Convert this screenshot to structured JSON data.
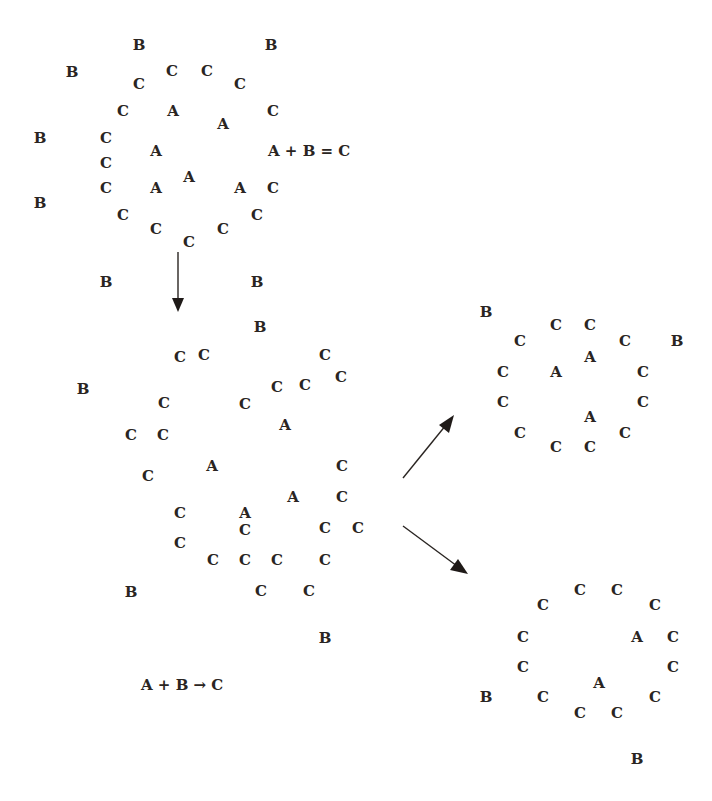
{
  "colors": {
    "ink": "#2a2522",
    "background": "#ffffff"
  },
  "panels": {
    "initial": {
      "label": "initial-state",
      "equation": "A + B = C",
      "particles": [
        {
          "s": "B",
          "p": [
            139,
            45
          ]
        },
        {
          "s": "B",
          "p": [
            271,
            45
          ]
        },
        {
          "s": "B",
          "p": [
            72,
            72
          ]
        },
        {
          "s": "B",
          "p": [
            40,
            138
          ]
        },
        {
          "s": "B",
          "p": [
            40,
            203
          ]
        },
        {
          "s": "B",
          "p": [
            106,
            282
          ]
        },
        {
          "s": "B",
          "p": [
            257,
            282
          ]
        },
        {
          "s": "C",
          "p": [
            172,
            71
          ]
        },
        {
          "s": "C",
          "p": [
            207,
            71
          ]
        },
        {
          "s": "C",
          "p": [
            139,
            84
          ]
        },
        {
          "s": "C",
          "p": [
            240,
            84
          ]
        },
        {
          "s": "C",
          "p": [
            123,
            111
          ]
        },
        {
          "s": "C",
          "p": [
            273,
            111
          ]
        },
        {
          "s": "C",
          "p": [
            106,
            138
          ]
        },
        {
          "s": "C",
          "p": [
            106,
            163
          ]
        },
        {
          "s": "C",
          "p": [
            106,
            188
          ]
        },
        {
          "s": "C",
          "p": [
            273,
            188
          ]
        },
        {
          "s": "C",
          "p": [
            123,
            215
          ]
        },
        {
          "s": "C",
          "p": [
            257,
            215
          ]
        },
        {
          "s": "C",
          "p": [
            156,
            229
          ]
        },
        {
          "s": "C",
          "p": [
            223,
            229
          ]
        },
        {
          "s": "C",
          "p": [
            189,
            242
          ]
        },
        {
          "s": "A",
          "p": [
            173,
            111
          ]
        },
        {
          "s": "A",
          "p": [
            223,
            124
          ]
        },
        {
          "s": "A",
          "p": [
            156,
            151
          ]
        },
        {
          "s": "A",
          "p": [
            189,
            177
          ]
        },
        {
          "s": "A",
          "p": [
            156,
            188
          ]
        },
        {
          "s": "A",
          "p": [
            240,
            188
          ]
        }
      ]
    },
    "intermediate": {
      "label": "intermediate-state",
      "equation": "A + B → C",
      "particles": [
        {
          "s": "B",
          "p": [
            260,
            327
          ]
        },
        {
          "s": "B",
          "p": [
            83,
            389
          ]
        },
        {
          "s": "B",
          "p": [
            131,
            592
          ]
        },
        {
          "s": "B",
          "p": [
            325,
            638
          ]
        },
        {
          "s": "C",
          "p": [
            180,
            357
          ]
        },
        {
          "s": "C",
          "p": [
            204,
            355
          ]
        },
        {
          "s": "C",
          "p": [
            325,
            355
          ]
        },
        {
          "s": "C",
          "p": [
            341,
            377
          ]
        },
        {
          "s": "C",
          "p": [
            277,
            387
          ]
        },
        {
          "s": "C",
          "p": [
            305,
            385
          ]
        },
        {
          "s": "C",
          "p": [
            164,
            403
          ]
        },
        {
          "s": "C",
          "p": [
            245,
            404
          ]
        },
        {
          "s": "C",
          "p": [
            131,
            435
          ]
        },
        {
          "s": "C",
          "p": [
            163,
            435
          ]
        },
        {
          "s": "C",
          "p": [
            148,
            476
          ]
        },
        {
          "s": "C",
          "p": [
            342,
            466
          ]
        },
        {
          "s": "C",
          "p": [
            342,
            497
          ]
        },
        {
          "s": "C",
          "p": [
            180,
            513
          ]
        },
        {
          "s": "C",
          "p": [
            245,
            530
          ]
        },
        {
          "s": "C",
          "p": [
            325,
            528
          ]
        },
        {
          "s": "C",
          "p": [
            358,
            528
          ]
        },
        {
          "s": "C",
          "p": [
            180,
            543
          ]
        },
        {
          "s": "C",
          "p": [
            213,
            560
          ]
        },
        {
          "s": "C",
          "p": [
            245,
            560
          ]
        },
        {
          "s": "C",
          "p": [
            277,
            560
          ]
        },
        {
          "s": "C",
          "p": [
            325,
            560
          ]
        },
        {
          "s": "C",
          "p": [
            261,
            591
          ]
        },
        {
          "s": "C",
          "p": [
            309,
            591
          ]
        },
        {
          "s": "A",
          "p": [
            285,
            425
          ]
        },
        {
          "s": "A",
          "p": [
            212,
            466
          ]
        },
        {
          "s": "A",
          "p": [
            293,
            497
          ]
        },
        {
          "s": "A",
          "p": [
            245,
            513
          ]
        }
      ]
    },
    "outcome_upper": {
      "label": "outcome-upper",
      "particles": [
        {
          "s": "B",
          "p": [
            486,
            312
          ]
        },
        {
          "s": "B",
          "p": [
            677,
            341
          ]
        },
        {
          "s": "C",
          "p": [
            520,
            341
          ]
        },
        {
          "s": "C",
          "p": [
            556,
            325
          ]
        },
        {
          "s": "C",
          "p": [
            590,
            325
          ]
        },
        {
          "s": "C",
          "p": [
            625,
            341
          ]
        },
        {
          "s": "C",
          "p": [
            503,
            372
          ]
        },
        {
          "s": "C",
          "p": [
            643,
            372
          ]
        },
        {
          "s": "C",
          "p": [
            503,
            402
          ]
        },
        {
          "s": "C",
          "p": [
            643,
            402
          ]
        },
        {
          "s": "C",
          "p": [
            520,
            433
          ]
        },
        {
          "s": "C",
          "p": [
            556,
            447
          ]
        },
        {
          "s": "C",
          "p": [
            590,
            447
          ]
        },
        {
          "s": "C",
          "p": [
            625,
            433
          ]
        },
        {
          "s": "A",
          "p": [
            556,
            372
          ]
        },
        {
          "s": "A",
          "p": [
            590,
            357
          ]
        },
        {
          "s": "A",
          "p": [
            590,
            417
          ]
        }
      ]
    },
    "outcome_lower": {
      "label": "outcome-lower",
      "particles": [
        {
          "s": "C",
          "p": [
            543,
            605
          ]
        },
        {
          "s": "C",
          "p": [
            580,
            590
          ]
        },
        {
          "s": "C",
          "p": [
            617,
            590
          ]
        },
        {
          "s": "C",
          "p": [
            655,
            605
          ]
        },
        {
          "s": "C",
          "p": [
            523,
            637
          ]
        },
        {
          "s": "C",
          "p": [
            673,
            637
          ]
        },
        {
          "s": "C",
          "p": [
            523,
            667
          ]
        },
        {
          "s": "C",
          "p": [
            673,
            667
          ]
        },
        {
          "s": "C",
          "p": [
            543,
            697
          ]
        },
        {
          "s": "C",
          "p": [
            580,
            713
          ]
        },
        {
          "s": "C",
          "p": [
            617,
            713
          ]
        },
        {
          "s": "C",
          "p": [
            655,
            697
          ]
        },
        {
          "s": "A",
          "p": [
            637,
            637
          ]
        },
        {
          "s": "A",
          "p": [
            599,
            683
          ]
        },
        {
          "s": "B",
          "p": [
            486,
            697
          ]
        },
        {
          "s": "B",
          "p": [
            637,
            759
          ]
        }
      ]
    }
  },
  "arrows": [
    {
      "name": "arrow-initial-to-intermediate",
      "direction": "down"
    },
    {
      "name": "arrow-intermediate-to-upper",
      "direction": "up-right"
    },
    {
      "name": "arrow-intermediate-to-lower",
      "direction": "down-right"
    }
  ]
}
